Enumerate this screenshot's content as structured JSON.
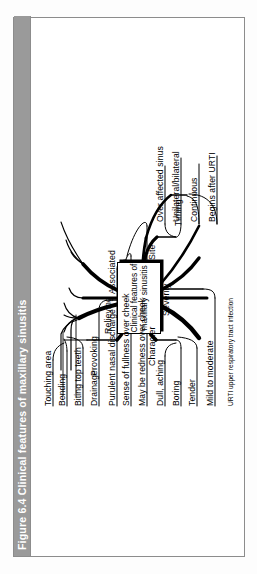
{
  "figure": {
    "number": "Figure 6.4",
    "title": "Clinical features of maxillary sinusitis",
    "title_full": "Figure 6.4  Clinical features of maxillary sinusitis",
    "footnote": "URTI upper respiratory tract infection",
    "orientation": "rotated-90-ccw",
    "colors": {
      "title_bar_bg": "#9a9a9a",
      "title_text": "#ffffff",
      "line": "#000000",
      "page_bg": "#ffffff",
      "border": "#8c8c8c"
    }
  },
  "centre_node": {
    "line1": "Clinical",
    "line2": "features",
    "line3": "of",
    "line4": "maxillary",
    "line5": "sinusitis",
    "text": "Clinical features of maxillary sinusitis"
  },
  "branches": [
    {
      "id": "provoking",
      "label": "Provoking",
      "children": [
        {
          "label": "Touching area"
        },
        {
          "label": "Bending"
        },
        {
          "label": "Biting top teeth"
        }
      ]
    },
    {
      "id": "relieving",
      "label": "Relieving",
      "children": [
        {
          "label": "Drainage"
        }
      ]
    },
    {
      "id": "associated",
      "label": "Associated",
      "children": [
        {
          "label": "Purulent nasal discharge"
        },
        {
          "label": "Sense of fullness over cheek"
        },
        {
          "label": "May be redness over cheek"
        }
      ]
    },
    {
      "id": "character",
      "label": "Character",
      "children": [
        {
          "label": "Dull, aching"
        },
        {
          "label": "Boring"
        },
        {
          "label": "Tender"
        }
      ]
    },
    {
      "id": "severity",
      "label": "Severity",
      "children": [
        {
          "label": "Mild to moderate"
        }
      ]
    },
    {
      "id": "site",
      "label": "Site",
      "children": [
        {
          "label": "Over affected sinus"
        },
        {
          "label": "Unilateral/bilateral"
        }
      ]
    },
    {
      "id": "timing",
      "label": "Timing",
      "children": [
        {
          "label": "Continuous"
        },
        {
          "label": "Begins after URTI"
        }
      ]
    }
  ]
}
